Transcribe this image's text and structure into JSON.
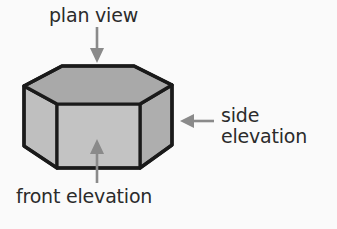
{
  "figure": {
    "background_color": "#fafafa",
    "outline_color": "#1a1a1a",
    "arrow_color": "#8a8a8a",
    "text_color": "#2b2b2b"
  },
  "labels": {
    "plan_view": "plan view",
    "side_elevation": "side\nelevation",
    "side_elevation_line1": "side",
    "side_elevation_line2": "elevation",
    "front_elevation": "front elevation"
  },
  "solid": {
    "name": "hexagonal-prism",
    "faces": [
      {
        "name": "top-face",
        "label": "plan view",
        "fill": "#a9a9a9"
      },
      {
        "name": "front-face",
        "label": "front elevation",
        "fill": "#c3c3c3"
      },
      {
        "name": "left-face",
        "label": "left side",
        "fill": "#bfbfbf"
      },
      {
        "name": "right-face",
        "label": "side elevation",
        "fill": "#aeaeae"
      }
    ]
  },
  "arrows": [
    {
      "name": "plan-view-arrow",
      "direction": "down",
      "points_to": "top-face"
    },
    {
      "name": "side-elevation-arrow",
      "direction": "left",
      "points_to": "right-face"
    },
    {
      "name": "front-elevation-arrow",
      "direction": "up",
      "points_to": "front-face"
    }
  ]
}
